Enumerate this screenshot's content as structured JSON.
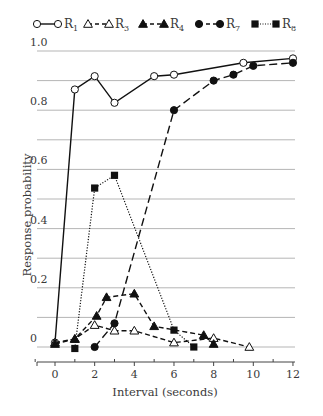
{
  "chart_data": {
    "type": "line",
    "title": "",
    "xlabel": "Interval (seconds)",
    "ylabel": "Response probability",
    "xlim": [
      -1,
      12
    ],
    "ylim": [
      0,
      1.0
    ],
    "x_ticks": [
      0,
      2,
      4,
      6,
      8,
      10,
      12
    ],
    "x_tick_labels": [
      "0",
      "2",
      "4",
      "6",
      "8",
      "10",
      "12"
    ],
    "y_ticks": [
      0,
      0.2,
      0.4,
      0.6,
      0.8,
      1.0
    ],
    "y_tick_labels": [
      "0",
      "0.2",
      "0.4",
      "0.6",
      "0.8",
      "1.0"
    ],
    "grid": true,
    "grid_step": 0.1,
    "legend_position": "top",
    "series": [
      {
        "name": "R1",
        "base": "R",
        "sub": "1",
        "marker": "circle-open",
        "line": "solid",
        "points": [
          [
            0,
            0.015
          ],
          [
            1,
            0.87
          ],
          [
            2,
            0.915
          ],
          [
            3,
            0.825
          ],
          [
            5,
            0.915
          ],
          [
            6,
            0.92
          ],
          [
            9.5,
            0.96
          ],
          [
            12,
            0.975
          ]
        ]
      },
      {
        "name": "R3",
        "base": "R",
        "sub": "3",
        "marker": "triangle-open",
        "line": "dashed",
        "points": [
          [
            0,
            0.015
          ],
          [
            1,
            0.027
          ],
          [
            2,
            0.074
          ],
          [
            3,
            0.055
          ],
          [
            4,
            0.055
          ],
          [
            6,
            0.015
          ],
          [
            8,
            0.03
          ],
          [
            9.8,
            0.0
          ]
        ]
      },
      {
        "name": "R4",
        "base": "R",
        "sub": "4",
        "marker": "triangle-filled",
        "line": "dashed",
        "points": [
          [
            0,
            0.01
          ],
          [
            1,
            0.027
          ],
          [
            2.1,
            0.105
          ],
          [
            2.6,
            0.168
          ],
          [
            4,
            0.18
          ],
          [
            5,
            0.07
          ],
          [
            7.5,
            0.04
          ],
          [
            8,
            0.01
          ]
        ]
      },
      {
        "name": "R7",
        "base": "R",
        "sub": "7",
        "marker": "circle-filled",
        "line": "longdash",
        "points": [
          [
            2,
            0.0
          ],
          [
            3,
            0.08
          ],
          [
            6,
            0.8
          ],
          [
            8,
            0.9
          ],
          [
            9,
            0.92
          ],
          [
            10,
            0.95
          ],
          [
            12,
            0.96
          ]
        ]
      },
      {
        "name": "R8",
        "base": "R",
        "sub": "8",
        "marker": "square-filled",
        "line": "dotted",
        "points": [
          [
            1,
            -0.005
          ],
          [
            2,
            0.537
          ],
          [
            3,
            0.58
          ],
          [
            6,
            0.057
          ],
          [
            7,
            0.0
          ]
        ]
      }
    ]
  }
}
